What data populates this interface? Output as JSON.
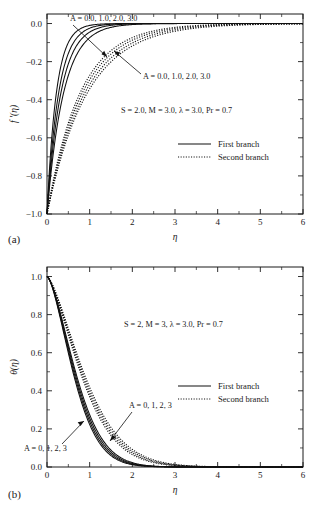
{
  "figure": {
    "panels": [
      {
        "tag": "(a)",
        "xlabel": "η",
        "ylabel_parts": {
          "f": "f",
          "prime": "′",
          "arg": "(η)"
        },
        "ylabel_text": "f ′(η)",
        "params_text": "S = 2.0, M = 3.0, λ = 3.0, Pr = 0.7",
        "label_first": "A = 0.0, 1.0, 2.0, 3.0",
        "label_second": "A = 0.0, 1.0, 2.0, 3.0",
        "legend": [
          {
            "label": "First branch",
            "style": "solid"
          },
          {
            "label": "Second branch",
            "style": "dotted"
          }
        ],
        "xticks": [
          "0",
          "1",
          "2",
          "3",
          "4",
          "5",
          "6"
        ],
        "yticks": [
          "0.0",
          "-0.2",
          "-0.4",
          "-0.6",
          "-0.8",
          "-1.0"
        ]
      },
      {
        "tag": "(b)",
        "xlabel": "η",
        "ylabel_text": "θ(η)",
        "params_text": "S = 2, M = 3, λ = 3.0, Pr = 0.7",
        "label_first": "A = 0, 1, 2, 3",
        "label_second": "A = 0, 1, 2, 3",
        "legend": [
          {
            "label": "First branch",
            "style": "solid"
          },
          {
            "label": "Second branch",
            "style": "dotted"
          }
        ],
        "xticks": [
          "0",
          "1",
          "2",
          "3",
          "4",
          "5",
          "6"
        ],
        "yticks": [
          "1.0",
          "0.8",
          "0.6",
          "0.4",
          "0.2",
          "0.0"
        ]
      }
    ]
  },
  "chart_data": [
    {
      "type": "line",
      "title": "",
      "panel": "(a)",
      "xlabel": "η",
      "ylabel": "f ′(η)",
      "xlim": [
        0,
        6
      ],
      "ylim": [
        -1.0,
        0.05
      ],
      "xticks": [
        0,
        1,
        2,
        3,
        4,
        5,
        6
      ],
      "yticks": [
        0.0,
        -0.2,
        -0.4,
        -0.6,
        -0.8,
        -1.0
      ],
      "grid": false,
      "legend_position": "center-right",
      "annotations": [
        "A = 0.0, 1.0, 2.0, 3.0",
        "A = 0.0, 1.0, 2.0, 3.0",
        "S = 2.0, M = 3.0, λ = 3.0, Pr = 0.7"
      ],
      "series": [
        {
          "name": "First branch A=0.0",
          "style": "solid",
          "decay": 4.6,
          "y0": -1.0,
          "yinf": 0.0
        },
        {
          "name": "First branch A=1.0",
          "style": "solid",
          "decay": 3.7,
          "y0": -1.0,
          "yinf": 0.0
        },
        {
          "name": "First branch A=2.0",
          "style": "solid",
          "decay": 3.1,
          "y0": -1.0,
          "yinf": 0.0
        },
        {
          "name": "First branch A=3.0",
          "style": "solid",
          "decay": 2.6,
          "y0": -1.0,
          "yinf": 0.0
        },
        {
          "name": "Second branch A=0.0",
          "style": "dotted",
          "decay": 1.3,
          "y0": -1.0,
          "yinf": 0.0
        },
        {
          "name": "Second branch A=1.0",
          "style": "dotted",
          "decay": 1.22,
          "y0": -1.0,
          "yinf": 0.0
        },
        {
          "name": "Second branch A=2.0",
          "style": "dotted",
          "decay": 1.14,
          "y0": -1.0,
          "yinf": 0.0
        },
        {
          "name": "Second branch A=3.0",
          "style": "dotted",
          "decay": 1.07,
          "y0": -1.0,
          "yinf": 0.0
        }
      ]
    },
    {
      "type": "line",
      "title": "",
      "panel": "(b)",
      "xlabel": "η",
      "ylabel": "θ(η)",
      "xlim": [
        0,
        6
      ],
      "ylim": [
        0.0,
        1.05
      ],
      "xticks": [
        0,
        1,
        2,
        3,
        4,
        5,
        6
      ],
      "yticks": [
        0.0,
        0.2,
        0.4,
        0.6,
        0.8,
        1.0
      ],
      "grid": false,
      "legend_position": "center-right",
      "annotations": [
        "A = 0, 1, 2, 3",
        "A = 0, 1, 2, 3",
        "S = 2, M = 3, λ = 3.0, Pr = 0.7"
      ],
      "series": [
        {
          "name": "First branch A=0",
          "style": "solid",
          "decay": 1.3,
          "shape": 1.55,
          "y0": 1.0,
          "yinf": 0.0
        },
        {
          "name": "First branch A=1",
          "style": "solid",
          "decay": 1.26,
          "shape": 1.55,
          "y0": 1.0,
          "yinf": 0.0
        },
        {
          "name": "First branch A=2",
          "style": "solid",
          "decay": 1.22,
          "shape": 1.55,
          "y0": 1.0,
          "yinf": 0.0
        },
        {
          "name": "First branch A=3",
          "style": "solid",
          "decay": 1.18,
          "shape": 1.55,
          "y0": 1.0,
          "yinf": 0.0
        },
        {
          "name": "Second branch A=0",
          "style": "dotted",
          "decay": 1.0,
          "shape": 1.45,
          "y0": 1.0,
          "yinf": 0.0
        },
        {
          "name": "Second branch A=1",
          "style": "dotted",
          "decay": 0.97,
          "shape": 1.45,
          "y0": 1.0,
          "yinf": 0.0
        },
        {
          "name": "Second branch A=2",
          "style": "dotted",
          "decay": 0.94,
          "shape": 1.45,
          "y0": 1.0,
          "yinf": 0.0
        },
        {
          "name": "Second branch A=3",
          "style": "dotted",
          "decay": 0.91,
          "shape": 1.45,
          "y0": 1.0,
          "yinf": 0.0
        }
      ]
    }
  ]
}
